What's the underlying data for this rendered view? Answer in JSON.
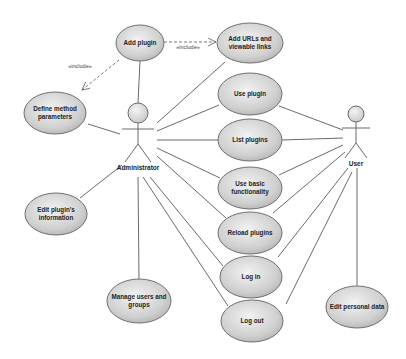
{
  "diagram": {
    "type": "uml-use-case",
    "colors": {
      "usecase_fill_light": "#f0f0f0",
      "usecase_fill_dark": "#b8b8b8",
      "stroke": "#6a6a6a",
      "background": "#ffffff"
    },
    "actors": [
      {
        "id": "administrator",
        "label": "Administrator",
        "x": 138,
        "headY": 113,
        "headR": 10
      },
      {
        "id": "user",
        "label": "User",
        "x": 356,
        "headY": 114,
        "headR": 8
      }
    ],
    "use_cases": [
      {
        "id": "add_plugin",
        "lines": [
          "Add plugin"
        ],
        "cx": 140,
        "cy": 43,
        "rx": 24,
        "ry": 18
      },
      {
        "id": "add_urls",
        "lines": [
          "Add URLs and",
          "viewable links"
        ],
        "cx": 250,
        "cy": 43,
        "rx": 33,
        "ry": 20
      },
      {
        "id": "define_method_parameters",
        "lines": [
          "Define method",
          "parameters"
        ],
        "cx": 55,
        "cy": 113,
        "rx": 31,
        "ry": 21
      },
      {
        "id": "use_plugin",
        "lines": [
          "Use plugin"
        ],
        "cx": 250,
        "cy": 94,
        "rx": 32,
        "ry": 21
      },
      {
        "id": "list_plugins",
        "lines": [
          "List plugins"
        ],
        "cx": 250,
        "cy": 140,
        "rx": 32,
        "ry": 21
      },
      {
        "id": "use_basic_functionality",
        "lines": [
          "Use basic",
          "functionality"
        ],
        "cx": 250,
        "cy": 188,
        "rx": 32,
        "ry": 21
      },
      {
        "id": "edit_plugin_information",
        "lines": [
          "Edit plugin's",
          "information"
        ],
        "cx": 56,
        "cy": 214,
        "rx": 31,
        "ry": 21
      },
      {
        "id": "reload_plugins",
        "lines": [
          "Reload plugins"
        ],
        "cx": 250,
        "cy": 233,
        "rx": 32,
        "ry": 21
      },
      {
        "id": "log_in",
        "lines": [
          "Log in"
        ],
        "cx": 251,
        "cy": 277,
        "rx": 31,
        "ry": 21
      },
      {
        "id": "log_out",
        "lines": [
          "Log out"
        ],
        "cx": 252,
        "cy": 321,
        "rx": 31,
        "ry": 21
      },
      {
        "id": "manage_users_groups",
        "lines": [
          "Manage users and",
          "groups"
        ],
        "cx": 139,
        "cy": 301,
        "rx": 32,
        "ry": 22
      },
      {
        "id": "edit_personal_data",
        "lines": [
          "Edit personal data"
        ],
        "cx": 357,
        "cy": 307,
        "rx": 31,
        "ry": 21
      }
    ],
    "associations": [
      {
        "actor": "administrator",
        "x1": 138,
        "y1": 103,
        "x2": 140,
        "y2": 61
      },
      {
        "actor": "administrator",
        "x1": 157,
        "y1": 123,
        "x2": 225,
        "y2": 62
      },
      {
        "actor": "administrator",
        "x1": 88,
        "y1": 124,
        "x2": 120,
        "y2": 134
      },
      {
        "actor": "administrator",
        "x1": 157,
        "y1": 131,
        "x2": 219,
        "y2": 105
      },
      {
        "actor": "administrator",
        "x1": 157,
        "y1": 140,
        "x2": 218,
        "y2": 140
      },
      {
        "actor": "administrator",
        "x1": 157,
        "y1": 148,
        "x2": 220,
        "y2": 178
      },
      {
        "actor": "administrator",
        "x1": 157,
        "y1": 156,
        "x2": 226,
        "y2": 218
      },
      {
        "actor": "administrator",
        "x1": 150,
        "y1": 177,
        "x2": 223,
        "y2": 266
      },
      {
        "actor": "administrator",
        "x1": 143,
        "y1": 177,
        "x2": 228,
        "y2": 306
      },
      {
        "actor": "administrator",
        "x1": 138,
        "y1": 177,
        "x2": 139,
        "y2": 279
      },
      {
        "actor": "administrator",
        "x1": 122,
        "y1": 165,
        "x2": 80,
        "y2": 198
      },
      {
        "actor": "user",
        "x1": 343,
        "y1": 130,
        "x2": 279,
        "y2": 106
      },
      {
        "actor": "user",
        "x1": 343,
        "y1": 138,
        "x2": 282,
        "y2": 140
      },
      {
        "actor": "user",
        "x1": 343,
        "y1": 145,
        "x2": 279,
        "y2": 175
      },
      {
        "actor": "user",
        "x1": 345,
        "y1": 152,
        "x2": 273,
        "y2": 213
      },
      {
        "actor": "user",
        "x1": 348,
        "y1": 168,
        "x2": 278,
        "y2": 257
      },
      {
        "actor": "user",
        "x1": 352,
        "y1": 172,
        "x2": 286,
        "y2": 304
      },
      {
        "actor": "user",
        "x1": 357,
        "y1": 168,
        "x2": 357,
        "y2": 286
      }
    ],
    "includes": [
      {
        "label": "«include»",
        "x1": 164,
        "y1": 42,
        "x2": 216,
        "y2": 42,
        "lx": 188,
        "ly": 49
      },
      {
        "label": "«include»",
        "x1": 119,
        "y1": 60,
        "x2": 82,
        "y2": 90,
        "lx": 80,
        "ly": 68
      }
    ]
  }
}
